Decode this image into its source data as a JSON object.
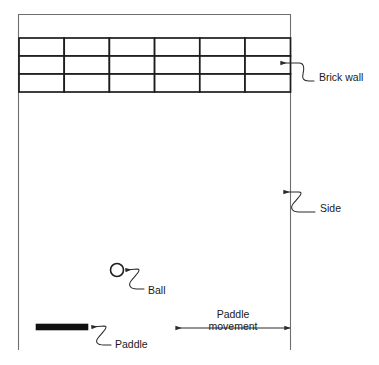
{
  "diagram": {
    "colors": {
      "background": "#ffffff",
      "frame": "#6e6e6e",
      "brick_stroke": "#1d1d1d",
      "paddle_fill": "#111111",
      "leader": "#2a2a2a",
      "text": "#1a1a1a"
    },
    "playfield": {
      "name": "play-area",
      "left": 18,
      "right": 291,
      "top": 14,
      "bottom": 350
    },
    "brick_wall": {
      "columns": 6,
      "rows": 3,
      "left": 19,
      "right": 290,
      "top": 38,
      "bottom": 92,
      "label": "Brick wall",
      "label_x": 319,
      "label_y": 78
    },
    "side": {
      "label": "Side",
      "label_x": 320,
      "label_y": 209
    },
    "ball": {
      "label": "Ball",
      "center_x": 117,
      "center_y": 270,
      "radius": 6.5,
      "label_x": 148,
      "label_y": 291
    },
    "paddle": {
      "label": "Paddle",
      "x": 36,
      "y": 324,
      "width": 52,
      "height": 6,
      "label_x": 115,
      "label_y": 345
    },
    "paddle_movement": {
      "label_line1": "Paddle",
      "label_line2": "movement",
      "arrow_left_x": 176,
      "arrow_right_x": 290,
      "arrow_y": 328,
      "label_x": 233,
      "label_y1": 315,
      "label_y2": 327
    }
  }
}
